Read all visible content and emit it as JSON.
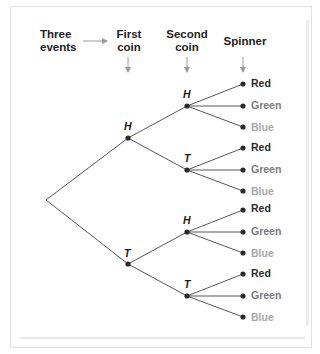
{
  "headers": {
    "three_events": "Three events",
    "three_events_line1": "Three",
    "three_events_line2": "events",
    "first_coin_line1": "First",
    "first_coin_line2": "coin",
    "second_coin_line1": "Second",
    "second_coin_line2": "coin",
    "spinner": "Spinner"
  },
  "tree": {
    "first_coin": [
      {
        "label": "H",
        "second_coin": [
          {
            "label": "H",
            "spinner": [
              "Red",
              "Green",
              "Blue"
            ]
          },
          {
            "label": "T",
            "spinner": [
              "Red",
              "Green",
              "Blue"
            ]
          }
        ]
      },
      {
        "label": "T",
        "second_coin": [
          {
            "label": "H",
            "spinner": [
              "Red",
              "Green",
              "Blue"
            ]
          },
          {
            "label": "T",
            "spinner": [
              "Red",
              "Green",
              "Blue"
            ]
          }
        ]
      }
    ]
  },
  "labels": {
    "n1": "H",
    "n2": "T",
    "n11": "H",
    "n12": "T",
    "n21": "H",
    "n22": "T",
    "l0": "Red",
    "l1": "Green",
    "l2": "Blue",
    "l3": "Red",
    "l4": "Green",
    "l5": "Blue",
    "l6": "Red",
    "l7": "Green",
    "l8": "Blue",
    "l9": "Red",
    "l10": "Green",
    "l11": "Blue"
  },
  "colors": {
    "red_label": "#2a2a2a",
    "green_label": "#7a7a7a",
    "blue_label": "#a8a8a8",
    "line": "#444444",
    "arrow": "#9a9a9a",
    "node": "#2a2a2a"
  }
}
